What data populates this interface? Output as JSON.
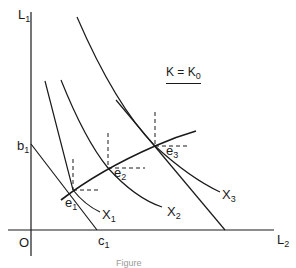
{
  "figure": {
    "axes": {
      "y_label": "L",
      "y_label_sub": "1",
      "x_label": "L",
      "x_label_sub": "2",
      "origin_label": "O"
    },
    "intercepts": {
      "b_label": "b",
      "b_sub": "1",
      "c_label": "c",
      "c_sub": "1"
    },
    "condition": {
      "lhs": "K = K",
      "sub": "0"
    },
    "points": [
      {
        "label": "e",
        "sub": "1"
      },
      {
        "label": "e",
        "sub": "2"
      },
      {
        "label": "e",
        "sub": "3"
      }
    ],
    "isoquants": [
      {
        "label": "X",
        "sub": "1"
      },
      {
        "label": "X",
        "sub": "2"
      },
      {
        "label": "X",
        "sub": "3"
      }
    ],
    "caption": "Figure"
  },
  "colors": {
    "ink": "#1a1a1a",
    "background": "#ffffff"
  }
}
